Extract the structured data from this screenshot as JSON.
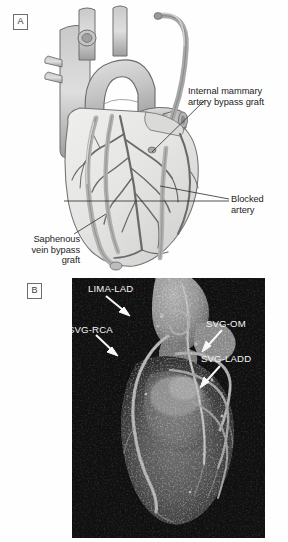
{
  "figure": {
    "panels": [
      {
        "letter": "A",
        "type": "illustration",
        "description": "Anterior view line-art illustration of the heart showing coronary artery bypass grafts",
        "labels": [
          {
            "name": "internal-mammary-artery-bypass-graft",
            "text": "Internal mammary\nartery bypass graft"
          },
          {
            "name": "blocked-artery",
            "text": "Blocked\nartery"
          },
          {
            "name": "saphenous-vein-bypass-graft",
            "text": "Saphenous\nvein bypass\ngraft"
          }
        ]
      },
      {
        "letter": "B",
        "type": "ct-volume-rendering",
        "description": "Three-dimensional volume-rendered cardiac CT angiogram of bypass grafts",
        "labels": [
          {
            "name": "lima-lad",
            "text": "LIMA-LAD"
          },
          {
            "name": "svg-rca",
            "text": "SVG-RCA"
          },
          {
            "name": "svg-om",
            "text": "SVG-OM"
          },
          {
            "name": "svg-ladd",
            "text": "SVG-LADD"
          }
        ]
      }
    ]
  },
  "colors": {
    "page_background": "#ffffff",
    "illustration_outline": "#5d5d5d",
    "illustration_myocardium": "#e4e4e2",
    "illustration_vessel": "#b8b8b8",
    "illustration_coronary": "#6a6a6a",
    "label_text": "#1d1d1d",
    "ct_background": "#050505",
    "ct_label_text": "#f4f4f4",
    "ct_arrow": "#f8f8f8",
    "panel_letter_border": "#6d6d6d"
  }
}
